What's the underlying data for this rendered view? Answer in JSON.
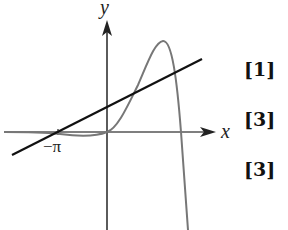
{
  "diagram": {
    "axes": {
      "x_label": "x",
      "y_label": "y",
      "tick_labels": [
        "−π"
      ]
    },
    "curves": [
      {
        "name": "straight-line",
        "color": "#111111",
        "description": "line crossing x-axis at −π with positive y-intercept"
      },
      {
        "name": "curve",
        "color": "#777777",
        "description": "curve slightly below x-axis for negative x, passes through origin, rises to a maximum then falls steeply"
      }
    ]
  },
  "marks": [
    "[1]",
    "[3]",
    "[3]"
  ]
}
